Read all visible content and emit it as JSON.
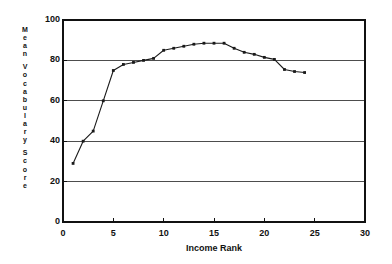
{
  "chart_data": {
    "type": "line",
    "title": "",
    "xlabel": "Income Rank",
    "ylabel": "Mean Vocabulary Score",
    "ylabel_chars": [
      "M",
      "e",
      "a",
      "n",
      " ",
      "V",
      "o",
      "c",
      "a",
      "b",
      "u",
      "l",
      "a",
      "r",
      "y",
      " ",
      "S",
      "c",
      "o",
      "r",
      "e"
    ],
    "xlim": [
      0,
      30
    ],
    "ylim": [
      0,
      100
    ],
    "xticks": [
      0,
      5,
      10,
      15,
      20,
      25,
      30
    ],
    "yticks": [
      0,
      20,
      40,
      60,
      80,
      100
    ],
    "xtick_labels": [
      "0",
      "5",
      "10",
      "15",
      "20",
      "25",
      "30"
    ],
    "ytick_labels": [
      "0",
      "20",
      "40",
      "60",
      "80",
      "100"
    ],
    "grid": "horizontal",
    "legend": "none",
    "marker": "filled-square",
    "line_color": "#1a1a1a",
    "grid_color": "#4d4d4d",
    "axis_color": "#111111",
    "x": [
      1,
      2,
      3,
      4,
      5,
      6,
      7,
      8,
      9,
      10,
      11,
      12,
      13,
      14,
      15,
      16,
      17,
      18,
      19,
      20,
      21,
      22,
      23,
      24
    ],
    "values": [
      29,
      40,
      45,
      60,
      75,
      78,
      79,
      80,
      81,
      85,
      86,
      87,
      88,
      88.5,
      88.5,
      88.5,
      86,
      84,
      83,
      81.5,
      80.5,
      75.5,
      74.5,
      74
    ],
    "series": [
      {
        "name": "Mean Vocabulary Score",
        "values": [
          29,
          40,
          45,
          60,
          75,
          78,
          79,
          80,
          81,
          85,
          86,
          87,
          88,
          88.5,
          88.5,
          88.5,
          86,
          84,
          83,
          81.5,
          80.5,
          75.5,
          74.5,
          74
        ]
      }
    ]
  }
}
